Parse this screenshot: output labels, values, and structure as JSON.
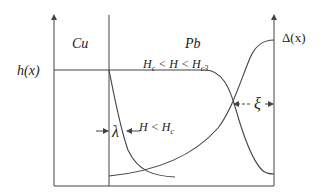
{
  "diagram": {
    "type": "superconducting proximity effect schematic (Cu/Pb interface)",
    "labels": {
      "cu_region": "Cu",
      "pb_region": "Pb",
      "y_left": "h(x)",
      "y_right": "Δ(x)",
      "field_intermediate": "Hc < H < Hc3",
      "field_low": "H < Hc",
      "penetration_depth": "λ",
      "coherence_length": "ξ"
    },
    "text_parts": {
      "field_intermediate": {
        "H1": "H",
        "sub1": "c",
        "mid": " < H < ",
        "H2": "H",
        "sub2": "c3"
      },
      "field_low": {
        "pre": "H < H",
        "sub": "c"
      }
    },
    "curves": [
      {
        "name": "h(x) for Hc<H<Hc3",
        "description": "flat across Cu and into Pb, then drops steeply near the right edge"
      },
      {
        "name": "h(x) for H<Hc",
        "description": "decays from interface into Pb over penetration depth λ"
      },
      {
        "name": "Δ(x)",
        "description": "small in Cu, rises in Pb toward bulk value at right"
      }
    ],
    "colors": {
      "line": "#444444",
      "text": "#222222",
      "background": "#ffffff"
    }
  }
}
